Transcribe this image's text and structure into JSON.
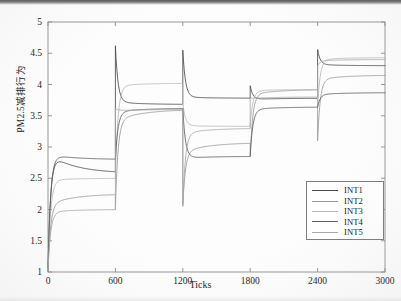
{
  "figure": {
    "title": "",
    "background_color": "#fdfdfd"
  },
  "axes": {
    "x_label": "Ticks",
    "y_label": "PM2.5减排行为",
    "x_ticks": [
      "0",
      "600",
      "1200",
      "1800",
      "2400",
      "3000"
    ],
    "y_ticks": [
      "1",
      "1.5",
      "2",
      "2.5",
      "3",
      "3.5",
      "4",
      "4.5",
      "5"
    ],
    "axis_color": "#8c8c8c"
  },
  "legend": {
    "position": "lower-right",
    "border_color": "#7d7d7d",
    "items": [
      {
        "label": "INT1",
        "color": "#4a4a4a"
      },
      {
        "label": "INT2",
        "color": "#9a9a9a"
      },
      {
        "label": "INT3",
        "color": "#b8b8b8"
      },
      {
        "label": "INT4",
        "color": "#5e5e5e"
      },
      {
        "label": "INT5",
        "color": "#a8a8a8"
      }
    ]
  },
  "chart_data": {
    "type": "line",
    "title": "",
    "xlabel": "Ticks",
    "ylabel": "PM2.5减排行为",
    "xlim": [
      0,
      3000
    ],
    "ylim": [
      1,
      5
    ],
    "xticks": [
      0,
      600,
      1200,
      1800,
      2400,
      3000
    ],
    "yticks": [
      1,
      1.5,
      2,
      2.5,
      3,
      3.5,
      4,
      4.5,
      5
    ],
    "grid": false,
    "legend_position": "lower right",
    "segment_boundaries": [
      0,
      600,
      1200,
      1800,
      2400,
      3000
    ],
    "series": [
      {
        "name": "INT1",
        "color": "#4a4a4a",
        "segments": [
          {
            "x_start": 0,
            "x_end": 600,
            "start_value": 1.02,
            "overshoot": 2.9,
            "plateau": 2.58
          },
          {
            "x_start": 600,
            "x_end": 1200,
            "start_value": 4.62,
            "overshoot": 3.72,
            "plateau": 3.68
          },
          {
            "x_start": 1200,
            "x_end": 1800,
            "start_value": 4.55,
            "overshoot": 3.8,
            "plateau": 3.78
          },
          {
            "x_start": 1800,
            "x_end": 2400,
            "start_value": 3.98,
            "overshoot": 3.76,
            "plateau": 3.78
          },
          {
            "x_start": 2400,
            "x_end": 3000,
            "start_value": 4.56,
            "overshoot": 4.32,
            "plateau": 4.3
          }
        ]
      },
      {
        "name": "INT2",
        "color": "#9a9a9a",
        "segments": [
          {
            "x_start": 0,
            "x_end": 600,
            "start_value": 1.05,
            "overshoot": 2.08,
            "plateau": 2.25
          },
          {
            "x_start": 600,
            "x_end": 1200,
            "start_value": 2.0,
            "overshoot": 3.42,
            "plateau": 3.6
          },
          {
            "x_start": 1200,
            "x_end": 1800,
            "start_value": 2.06,
            "overshoot": 2.92,
            "plateau": 3.07
          },
          {
            "x_start": 1800,
            "x_end": 2400,
            "start_value": 2.85,
            "overshoot": 3.84,
            "plateau": 3.92
          },
          {
            "x_start": 2400,
            "x_end": 3000,
            "start_value": 3.1,
            "overshoot": 4.08,
            "plateau": 4.15
          }
        ]
      },
      {
        "name": "INT3",
        "color": "#b8b8b8",
        "segments": [
          {
            "x_start": 0,
            "x_end": 600,
            "start_value": 1.04,
            "overshoot": 2.47,
            "plateau": 2.5
          },
          {
            "x_start": 600,
            "x_end": 1200,
            "start_value": 2.52,
            "overshoot": 3.98,
            "plateau": 4.02
          },
          {
            "x_start": 1200,
            "x_end": 1800,
            "start_value": 3.7,
            "overshoot": 3.34,
            "plateau": 3.33
          },
          {
            "x_start": 1800,
            "x_end": 2400,
            "start_value": 3.34,
            "overshoot": 3.9,
            "plateau": 3.92
          },
          {
            "x_start": 2400,
            "x_end": 3000,
            "start_value": 3.65,
            "overshoot": 4.4,
            "plateau": 4.43
          }
        ]
      },
      {
        "name": "INT4",
        "color": "#5e5e5e",
        "segments": [
          {
            "x_start": 0,
            "x_end": 600,
            "start_value": 1.06,
            "overshoot": 2.88,
            "plateau": 2.8
          },
          {
            "x_start": 600,
            "x_end": 1200,
            "start_value": 2.8,
            "overshoot": 3.56,
            "plateau": 3.62
          },
          {
            "x_start": 1200,
            "x_end": 1800,
            "start_value": 3.62,
            "overshoot": 2.82,
            "plateau": 2.85
          },
          {
            "x_start": 1800,
            "x_end": 2400,
            "start_value": 2.85,
            "overshoot": 3.6,
            "plateau": 3.64
          },
          {
            "x_start": 2400,
            "x_end": 3000,
            "start_value": 3.64,
            "overshoot": 3.84,
            "plateau": 3.87
          }
        ]
      },
      {
        "name": "INT5",
        "color": "#a8a8a8",
        "segments": [
          {
            "x_start": 0,
            "x_end": 600,
            "start_value": 1.02,
            "overshoot": 1.96,
            "plateau": 2.0
          },
          {
            "x_start": 600,
            "x_end": 1200,
            "start_value": 3.62,
            "overshoot": 3.58,
            "plateau": 3.6
          },
          {
            "x_start": 1200,
            "x_end": 1800,
            "start_value": 2.05,
            "overshoot": 3.22,
            "plateau": 3.3
          },
          {
            "x_start": 1800,
            "x_end": 2400,
            "start_value": 3.78,
            "overshoot": 3.78,
            "plateau": 3.8
          },
          {
            "x_start": 2400,
            "x_end": 3000,
            "start_value": 4.3,
            "overshoot": 4.38,
            "plateau": 4.4
          }
        ]
      }
    ]
  }
}
